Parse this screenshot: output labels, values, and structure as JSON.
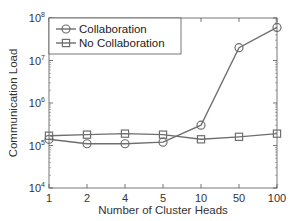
{
  "chart_data": {
    "type": "line",
    "title": "",
    "xlabel": "Number of Cluster Heads",
    "ylabel": "Communication Load",
    "categories": [
      "1",
      "2",
      "4",
      "5",
      "10",
      "50",
      "100"
    ],
    "yscale": "log",
    "ylim": [
      10000,
      100000000
    ],
    "yticks": [
      {
        "base": "10",
        "exp": "4",
        "value": 10000
      },
      {
        "base": "10",
        "exp": "5",
        "value": 100000
      },
      {
        "base": "10",
        "exp": "6",
        "value": 1000000
      },
      {
        "base": "10",
        "exp": "7",
        "value": 10000000
      },
      {
        "base": "10",
        "exp": "8",
        "value": 100000000
      }
    ],
    "grid": false,
    "legend_position": "upper left",
    "series": [
      {
        "name": "Collaboration",
        "marker": "circle",
        "color": "#6e6e6e",
        "values": [
          140000,
          110000,
          110000,
          120000,
          300000,
          20000000,
          60000000
        ]
      },
      {
        "name": "No Collaboration",
        "marker": "square",
        "color": "#6e6e6e",
        "values": [
          170000,
          180000,
          190000,
          180000,
          140000,
          160000,
          190000
        ]
      }
    ]
  }
}
